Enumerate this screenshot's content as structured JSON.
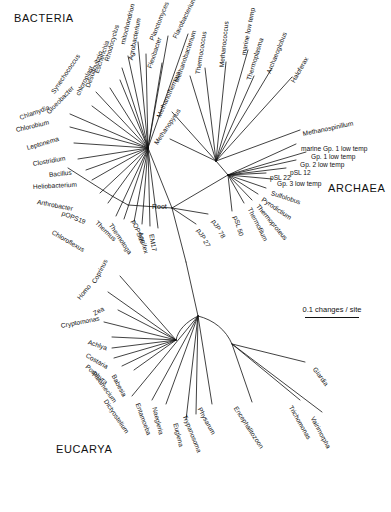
{
  "figure": {
    "type": "unrooted-phylogenetic-tree",
    "title": "",
    "scale": {
      "label": "0.1 changes / site",
      "value": 0.1,
      "unit": "changes / site"
    },
    "root_label": "Root",
    "domains": [
      {
        "name": "BACTERIA",
        "x": 14,
        "y": 18
      },
      {
        "name": "ARCHAEA",
        "x": 328,
        "y": 188
      },
      {
        "name": "EUCARYA",
        "x": 56,
        "y": 449
      }
    ]
  },
  "bacteria": {
    "heading": "BACTERIA",
    "taxa": [
      "Leptonema",
      "Clostridium",
      "Bacillus",
      "Heliobacterium",
      "Arthrobacter",
      "pOPS19",
      "Chloroflexus",
      "Thermus",
      "Thermotoga",
      "pOPS66",
      "Aquifex",
      "EM17",
      "Chlorobium",
      "Chlamydia",
      "Gloeobacter",
      "Synechococcus",
      "chloroplast",
      "Desulfovibrio",
      "Escherichia",
      "Rhodocyclus",
      "mitochondrion",
      "Agrobacterium",
      "Flexibacter",
      "Planctomyces",
      "Flavobacterium"
    ]
  },
  "archaea": {
    "heading": "ARCHAEA",
    "taxa": [
      "Methanobacterium",
      "Methanothermus",
      "Methanopyrus",
      "Thermococcus",
      "Methanococcus",
      "marine low temp",
      "Thermoplasma",
      "Archaeoglobus",
      "Haloferax",
      "Methanospirillum",
      "marine Gp. 1 low temp",
      "Gp. 1 low temp",
      "Gp. 2 low temp",
      "pSL 12",
      "pSL 22",
      "Gp. 3 low temp",
      "Sulfolobus",
      "Pyrodictium",
      "Thermoproteus",
      "Thermofilum",
      "pSL 50",
      "pJP 78",
      "pJP 27"
    ]
  },
  "eucarya": {
    "heading": "EUCARYA",
    "taxa": [
      "Coprinus",
      "Homo",
      "Zea",
      "Cryptomonas",
      "Achlya",
      "Costaria",
      "Porphyra",
      "Paramecium",
      "Babesia",
      "Dictyostelium",
      "Entamoeba",
      "Naegleria",
      "Euglena",
      "Trypanosoma",
      "Physarum",
      "Encephalitozoon",
      "Giardia",
      "Trichomonas",
      "Vairimorpha"
    ]
  },
  "labels": {
    "bacteria_nodes": [
      {
        "t": "Leptonema",
        "x": 27,
        "y": 145,
        "rot": -16
      },
      {
        "t": "Clostridium",
        "x": 33,
        "y": 161,
        "rot": -10
      },
      {
        "t": "Bacillus",
        "x": 49,
        "y": 172,
        "rot": -6
      },
      {
        "t": "Heliobacterium",
        "x": 33,
        "y": 184,
        "rot": -3
      },
      {
        "t": "Arthrobacter",
        "x": 37,
        "y": 199,
        "rot": 11
      },
      {
        "t": "pOPS19",
        "x": 62,
        "y": 210,
        "rot": 22
      },
      {
        "t": "Chloroflexus",
        "x": 52,
        "y": 229,
        "rot": 30
      },
      {
        "t": "Thermus",
        "x": 96,
        "y": 219,
        "rot": 44
      },
      {
        "t": "Thermotoga",
        "x": 110,
        "y": 221,
        "rot": 56
      },
      {
        "t": "pOPS66",
        "x": 133,
        "y": 217,
        "rot": 68
      },
      {
        "t": "Aquifex",
        "x": 140,
        "y": 229,
        "rot": 74
      },
      {
        "t": "EM17",
        "x": 151,
        "y": 231,
        "rot": 80
      },
      {
        "t": "Chlorobium",
        "x": 16,
        "y": 127,
        "rot": -13
      },
      {
        "t": "Chlamydia",
        "x": 20,
        "y": 115,
        "rot": -20
      },
      {
        "t": "Gloeobacter",
        "x": 48,
        "y": 110,
        "rot": -46
      },
      {
        "t": "Synechococcus",
        "x": 53,
        "y": 90,
        "rot": -56
      },
      {
        "t": "chloroplast",
        "x": 78,
        "y": 92,
        "rot": -64
      },
      {
        "t": "Desulfovibrio",
        "x": 88,
        "y": 84,
        "rot": -70
      },
      {
        "t": "Escherichia",
        "x": 97,
        "y": 70,
        "rot": -72
      },
      {
        "t": "Rhodocyclus",
        "x": 107,
        "y": 58,
        "rot": -74
      },
      {
        "t": "mitochondrion",
        "x": 123,
        "y": 41,
        "rot": -76
      },
      {
        "t": "Agrobacterium",
        "x": 131,
        "y": 57,
        "rot": -79
      },
      {
        "t": "Flexibacter",
        "x": 150,
        "y": 65,
        "rot": -72
      },
      {
        "t": "Planctomyces",
        "x": 152,
        "y": 37,
        "rot": -68
      },
      {
        "t": "Flavobacterium",
        "x": 175,
        "y": 35,
        "rot": -64
      }
    ],
    "archaea_nodes": [
      {
        "t": "Methanobacterium",
        "x": 177,
        "y": 79,
        "rot": -71
      },
      {
        "t": "Methanothermus",
        "x": 159,
        "y": 114,
        "rot": -66
      },
      {
        "t": "Methanopyrus",
        "x": 156,
        "y": 141,
        "rot": -56
      },
      {
        "t": "Thermococcus",
        "x": 198,
        "y": 71,
        "rot": -81
      },
      {
        "t": "Methanococcus",
        "x": 222,
        "y": 64,
        "rot": -84
      },
      {
        "t": "marine low temp",
        "x": 244,
        "y": 52,
        "rot": -79
      },
      {
        "t": "Thermoplasma",
        "x": 249,
        "y": 77,
        "rot": -73
      },
      {
        "t": "Archaeoglobus",
        "x": 269,
        "y": 70,
        "rot": -68
      },
      {
        "t": "Haloferax",
        "x": 293,
        "y": 79,
        "rot": -60
      },
      {
        "t": "Methanospinillum",
        "x": 303,
        "y": 131,
        "rot": -12
      },
      {
        "t": "marine Gp. 1 low temp",
        "x": 301,
        "y": 146,
        "rot": 0
      },
      {
        "t": "Gp. 1 low temp",
        "x": 311,
        "y": 154,
        "rot": 0
      },
      {
        "t": "Gp. 2 low temp",
        "x": 300,
        "y": 162,
        "rot": 0
      },
      {
        "t": "pSL 12",
        "x": 290,
        "y": 170,
        "rot": 0
      },
      {
        "t": "pSL 22",
        "x": 270,
        "y": 175,
        "rot": 0
      },
      {
        "t": "Gp. 3 low temp",
        "x": 277,
        "y": 181,
        "rot": 0
      },
      {
        "t": "Sulfolobus",
        "x": 271,
        "y": 190,
        "rot": 18
      },
      {
        "t": "Pyrodictium",
        "x": 262,
        "y": 196,
        "rot": 34
      },
      {
        "t": "Thermoproteus",
        "x": 257,
        "y": 202,
        "rot": 50
      },
      {
        "t": "Thermofilum",
        "x": 249,
        "y": 205,
        "rot": 63
      },
      {
        "t": "pSL 50",
        "x": 235,
        "y": 213,
        "rot": 73
      },
      {
        "t": "pJP 78",
        "x": 213,
        "y": 217,
        "rot": 60
      },
      {
        "t": "pJP 27",
        "x": 198,
        "y": 226,
        "rot": 60
      }
    ],
    "eucarya_nodes": [
      {
        "t": "Coprinus",
        "x": 94,
        "y": 280,
        "rot": -62
      },
      {
        "t": "Homo",
        "x": 79,
        "y": 296,
        "rot": -52
      },
      {
        "t": "Zea",
        "x": 94,
        "y": 311,
        "rot": -30
      },
      {
        "t": "Cryptomonas",
        "x": 61,
        "y": 323,
        "rot": -11
      },
      {
        "t": "Achlya",
        "x": 88,
        "y": 339,
        "rot": 19
      },
      {
        "t": "Costaria",
        "x": 86,
        "y": 352,
        "rot": 30
      },
      {
        "t": "Porphyra",
        "x": 86,
        "y": 363,
        "rot": 40
      },
      {
        "t": "Paramecium",
        "x": 93,
        "y": 369,
        "rot": 54
      },
      {
        "t": "Babesia",
        "x": 113,
        "y": 372,
        "rot": 62
      },
      {
        "t": "Dictyostelium",
        "x": 105,
        "y": 397,
        "rot": 56
      },
      {
        "t": "Entamoeba",
        "x": 137,
        "y": 400,
        "rot": 70
      },
      {
        "t": "Naegleria",
        "x": 154,
        "y": 404,
        "rot": 76
      },
      {
        "t": "Euglena",
        "x": 175,
        "y": 420,
        "rot": 76
      },
      {
        "t": "Trypanosoma",
        "x": 184,
        "y": 412,
        "rot": 68
      },
      {
        "t": "Physarum",
        "x": 199,
        "y": 405,
        "rot": 61
      },
      {
        "t": "Encephalitozoon",
        "x": 235,
        "y": 404,
        "rot": 57
      },
      {
        "t": "Giardia",
        "x": 314,
        "y": 365,
        "rot": 54
      },
      {
        "t": "Trichomonas",
        "x": 290,
        "y": 403,
        "rot": 60
      },
      {
        "t": "Vairimorpha",
        "x": 312,
        "y": 414,
        "rot": 62
      }
    ]
  },
  "chart_data": {
    "type": "tree",
    "layout": "unrooted radial",
    "scale_bar": {
      "text": "0.1 changes / site",
      "value": 0.1
    },
    "root": {
      "label": "Root",
      "x": 172,
      "y": 208
    },
    "branch_points": {
      "bacteria_hub": {
        "x": 148,
        "y": 148
      },
      "archaea_hub": {
        "x": 228,
        "y": 175
      },
      "archaea_upper_hub": {
        "x": 216,
        "y": 161
      },
      "eucarya_hub": {
        "x": 205,
        "y": 338
      }
    },
    "groups": [
      {
        "name": "BACTERIA",
        "count": 25
      },
      {
        "name": "ARCHAEA",
        "count": 23
      },
      {
        "name": "EUCARYA",
        "count": 19
      }
    ]
  }
}
